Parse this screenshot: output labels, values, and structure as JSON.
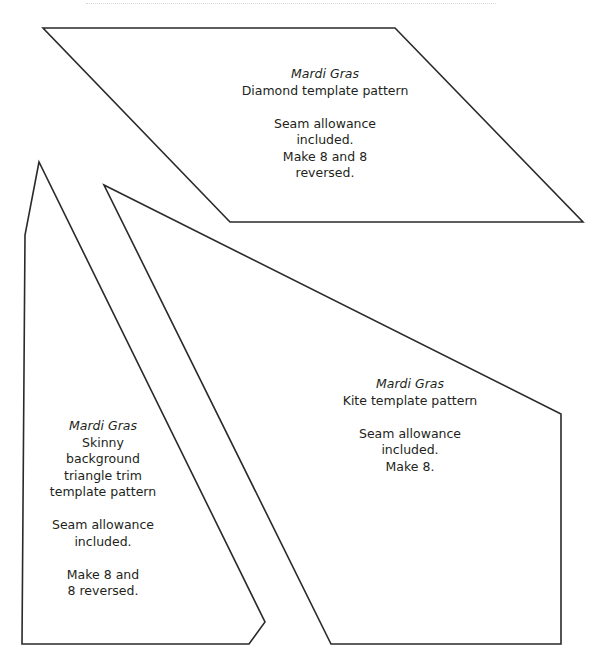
{
  "page": {
    "background": "#ffffff",
    "stroke_color": "#2a2a2a",
    "text_color": "#231f20"
  },
  "shapes": {
    "diamond": {
      "points": "43,28 395,28 583,222 230,222",
      "label": {
        "title": "Mardi Gras",
        "subtitle": "Diamond template pattern",
        "line1": "Seam allowance",
        "line2": "included.",
        "line3": "Make 8 and 8",
        "line4": "reversed."
      }
    },
    "skinny_triangle": {
      "points": "39,162 25,235 22,644 249,644 265,622",
      "label": {
        "title": "Mardi Gras",
        "line1": "Skinny",
        "line2": "background",
        "line3": "triangle trim",
        "line4": "template pattern",
        "line5": "Seam allowance",
        "line6": "included.",
        "line7": "Make 8 and",
        "line8": "8 reversed."
      }
    },
    "kite": {
      "points": "104,185 561,414 561,644 331,644",
      "label": {
        "title": "Mardi Gras",
        "subtitle": "Kite template pattern",
        "line1": "Seam allowance",
        "line2": "included.",
        "line3": "Make 8."
      }
    }
  }
}
